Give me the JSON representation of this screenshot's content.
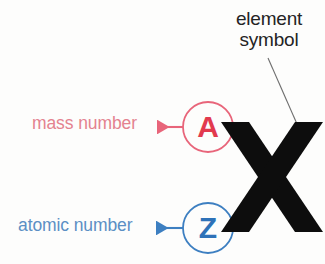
{
  "figure": {
    "background_color": "#fdfdfc"
  },
  "element_symbol": {
    "callout_line1": "element",
    "callout_line2": "symbol",
    "color": "#242424",
    "symbol_glyph": "X",
    "symbol_color": "#0d0d0d",
    "leader_line_color": "#6e6e6e"
  },
  "mass_number": {
    "label": "mass number",
    "glyph": "A",
    "text_color": "#e4828f",
    "accent_color": "#e23a4e",
    "arrow_direction": "left"
  },
  "atomic_number": {
    "label": "atomic number",
    "glyph": "Z",
    "text_color": "#5b8fc4",
    "accent_color": "#2e72b8",
    "arrow_direction": "left"
  }
}
